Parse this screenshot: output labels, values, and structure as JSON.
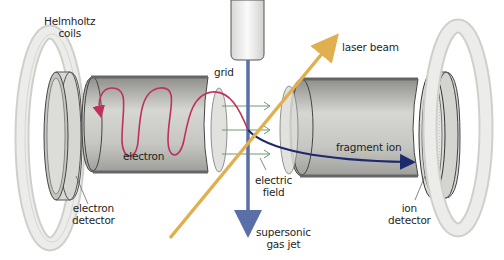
{
  "diagram": {
    "labels": {
      "helmholtz_coils": [
        "Helmholtz",
        "coils"
      ],
      "grid": "grid",
      "laser_beam": "laser beam",
      "electron": "electron",
      "fragment_ion": "fragment ion",
      "electric_field": [
        "electric",
        "field"
      ],
      "electron_detector": [
        "electron",
        "detector"
      ],
      "ion_detector": [
        "ion",
        "detector"
      ],
      "supersonic_gas_jet": [
        "supersonic",
        "gas jet"
      ]
    },
    "colors": {
      "laser_beam": "#e0b050",
      "gas_jet": "#5a6fa8",
      "electron_path": "#c0305a",
      "ion_path": "#1e2a6e",
      "field_arrows": "#6e9a72",
      "tube_gray": "#a8a8a4",
      "coil_gray": "#e2e2de"
    },
    "components": [
      "Helmholtz coil (left)",
      "electron detector",
      "electron flight tube",
      "grid",
      "nozzle",
      "grid (ion side)",
      "ion flight tube",
      "ion detector",
      "Helmholtz coil (right)"
    ]
  }
}
